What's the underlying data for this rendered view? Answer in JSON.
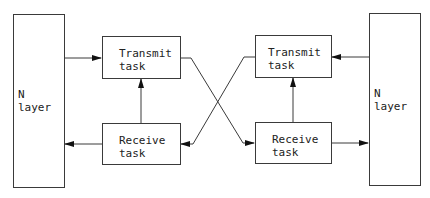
{
  "diagram": {
    "left": {
      "layer_label": "N layer",
      "transmit": {
        "line1": "Transmit",
        "line2": "task"
      },
      "receive": {
        "line1": "Receive",
        "line2": "task"
      }
    },
    "right": {
      "layer_label": "N layer",
      "transmit": {
        "line1": "Transmit",
        "line2": "task"
      },
      "receive": {
        "line1": "Receive",
        "line2": "task"
      }
    },
    "connections": [
      {
        "from": "left.N layer",
        "to": "left.Transmit task"
      },
      {
        "from": "left.Receive task",
        "to": "left.Transmit task"
      },
      {
        "from": "left.Receive task",
        "to": "left.N layer"
      },
      {
        "from": "left.Transmit task",
        "to": "right.Receive task"
      },
      {
        "from": "right.Transmit task",
        "to": "left.Receive task"
      },
      {
        "from": "right.N layer",
        "to": "right.Transmit task"
      },
      {
        "from": "right.Receive task",
        "to": "right.Transmit task"
      },
      {
        "from": "right.Receive task",
        "to": "right.N layer"
      }
    ],
    "line_color": "#3a3a3a"
  }
}
